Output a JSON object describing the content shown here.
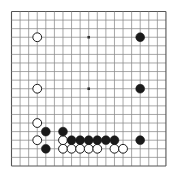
{
  "board": {
    "title": "Go board position",
    "size": 19,
    "geometry": {
      "origin_x": 11.5,
      "origin_y": 11.5,
      "spacing": 8.58,
      "stone_radius": 4.4,
      "canvas_width": 178,
      "canvas_height": 182
    },
    "colors": {
      "background": "#ffffff",
      "grid_line": "#8a8a8a",
      "grid_line_major": "#6d6d6d",
      "border": "#555555",
      "black_stone": "#1a1a1a",
      "white_stone_fill": "#ffffff",
      "white_stone_edge": "#1a1a1a",
      "star_point": "#333333"
    },
    "star_points": [
      {
        "col": 9,
        "row": 3
      },
      {
        "col": 9,
        "row": 9
      }
    ],
    "black_stones": [
      {
        "col": 15,
        "row": 3
      },
      {
        "col": 15,
        "row": 9
      },
      {
        "col": 4,
        "row": 14
      },
      {
        "col": 6,
        "row": 14
      },
      {
        "col": 7,
        "row": 15
      },
      {
        "col": 8,
        "row": 15
      },
      {
        "col": 9,
        "row": 15
      },
      {
        "col": 10,
        "row": 15
      },
      {
        "col": 11,
        "row": 15
      },
      {
        "col": 12,
        "row": 15
      },
      {
        "col": 15,
        "row": 15
      },
      {
        "col": 4,
        "row": 16
      }
    ],
    "white_stones": [
      {
        "col": 3,
        "row": 3
      },
      {
        "col": 3,
        "row": 9
      },
      {
        "col": 3,
        "row": 13
      },
      {
        "col": 3,
        "row": 15
      },
      {
        "col": 6,
        "row": 15
      },
      {
        "col": 6,
        "row": 16
      },
      {
        "col": 7,
        "row": 16
      },
      {
        "col": 8,
        "row": 16
      },
      {
        "col": 9,
        "row": 16
      },
      {
        "col": 10,
        "row": 16
      },
      {
        "col": 12,
        "row": 16
      },
      {
        "col": 13,
        "row": 16
      }
    ]
  }
}
